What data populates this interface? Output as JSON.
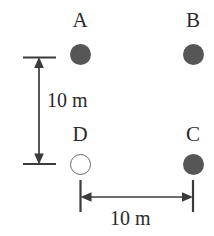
{
  "figure": {
    "type": "point-layout-diagram",
    "background_color": "#ffffff",
    "marker_fill_color": "#565656",
    "marker_open_color": "#ffffff",
    "line_color": "#3a3a3a",
    "nodes": [
      {
        "label": "A",
        "marker": "filled-circle",
        "x": 80.5,
        "y": 54.5
      },
      {
        "label": "B",
        "marker": "filled-circle",
        "x": 193.0,
        "y": 54.5
      },
      {
        "label": "D",
        "marker": "open-circle",
        "x": 80.5,
        "y": 164.5
      },
      {
        "label": "C",
        "marker": "filled-circle",
        "x": 193.0,
        "y": 164.5
      }
    ],
    "dimensions": [
      {
        "id": "vertical",
        "label": "10 m",
        "orientation": "vertical",
        "from": "A",
        "to": "D"
      },
      {
        "id": "horizontal",
        "label": "10 m",
        "orientation": "horizontal",
        "from": "D",
        "to": "C"
      }
    ]
  }
}
